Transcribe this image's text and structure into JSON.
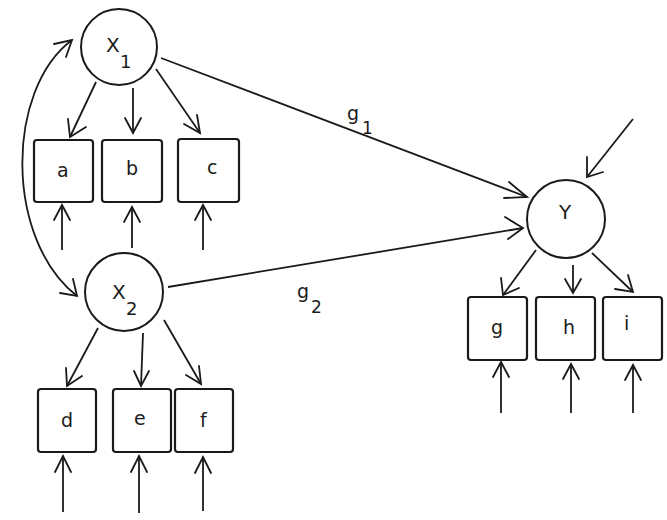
{
  "diagram": {
    "type": "structural-equation-model",
    "latent_nodes": [
      {
        "id": "X1",
        "label": "X",
        "subscript": "1",
        "cx": 119,
        "cy": 47,
        "r": 38
      },
      {
        "id": "X2",
        "label": "X",
        "subscript": "2",
        "cx": 124,
        "cy": 292,
        "r": 39
      },
      {
        "id": "Y",
        "label": "Y",
        "subscript": "",
        "cx": 566,
        "cy": 219,
        "r": 39
      }
    ],
    "indicator_nodes": [
      {
        "id": "a",
        "label": "a",
        "parent": "X1"
      },
      {
        "id": "b",
        "label": "b",
        "parent": "X1"
      },
      {
        "id": "c",
        "label": "c",
        "parent": "X1"
      },
      {
        "id": "d",
        "label": "d",
        "parent": "X2"
      },
      {
        "id": "e",
        "label": "e",
        "parent": "X2"
      },
      {
        "id": "f",
        "label": "f",
        "parent": "X2"
      },
      {
        "id": "g",
        "label": "g",
        "parent": "Y"
      },
      {
        "id": "h",
        "label": "h",
        "parent": "Y"
      },
      {
        "id": "i",
        "label": "i",
        "parent": "Y"
      }
    ],
    "structural_paths": [
      {
        "from": "X1",
        "to": "Y",
        "label": "g",
        "subscript": "1"
      },
      {
        "from": "X2",
        "to": "Y",
        "label": "g",
        "subscript": "2"
      }
    ],
    "covariance": {
      "between": [
        "X1",
        "X2"
      ],
      "style": "curved-double-headed"
    },
    "error_terms": [
      "a",
      "b",
      "c",
      "d",
      "e",
      "f",
      "g",
      "h",
      "i"
    ],
    "disturbance": {
      "target": "Y"
    }
  },
  "labels": {
    "x1_main": "X",
    "x1_sub": "1",
    "x2_main": "X",
    "x2_sub": "2",
    "y_main": "Y",
    "box_a": "a",
    "box_b": "b",
    "box_c": "c",
    "box_d": "d",
    "box_e": "e",
    "box_f": "f",
    "box_g": "g",
    "box_h": "h",
    "box_i": "i",
    "g1_main": "g",
    "g1_sub": "1",
    "g2_main": "g",
    "g2_sub": "2"
  },
  "colors": {
    "ink": "#1a1a1a",
    "background": "#ffffff"
  }
}
